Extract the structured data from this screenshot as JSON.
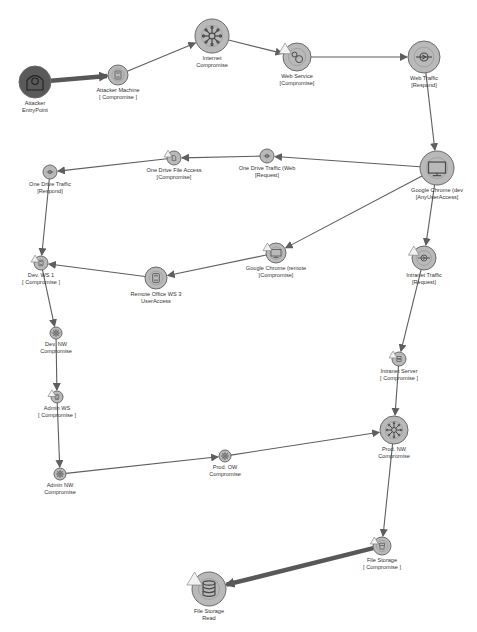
{
  "diagram": {
    "colors": {
      "node_fill": "#b9b9b9",
      "node_stroke": "#6a6a6a",
      "entry_fill": "#5a5a5a",
      "edge": "#5e5e5e",
      "critical_edge": "#585858",
      "label": "#333333",
      "warning": "#f2f2f2"
    },
    "nodes": [
      {
        "id": "attacker_entry",
        "label_1": "Attacker",
        "label_2": "EntryPoint",
        "x": 35,
        "y": 82,
        "r": 16,
        "icon": "hacker-icon",
        "kind": "entry",
        "warning": false
      },
      {
        "id": "attacker_machine",
        "label_1": "Attacker Machine",
        "label_2": "[ Compromise ]",
        "x": 118,
        "y": 75,
        "r": 10,
        "icon": "workstation-icon",
        "warning": false
      },
      {
        "id": "internet",
        "label_1": "Internet",
        "label_2": "Compromise",
        "x": 212,
        "y": 36,
        "r": 17,
        "icon": "network-hub-icon",
        "warning": false
      },
      {
        "id": "web_service",
        "label_1": "Web Service",
        "label_2": "[Compromise]",
        "x": 297,
        "y": 57,
        "r": 14,
        "icon": "gears-icon",
        "warning": true
      },
      {
        "id": "web_traffic",
        "label_1": "Web Traffic",
        "label_2": "[Respond]",
        "x": 424,
        "y": 57,
        "r": 16,
        "icon": "traffic-icon",
        "warning": false
      },
      {
        "id": "chrome_dev",
        "label_1": "Google Chrome (dev",
        "label_2": "[AnyUserAccess]",
        "x": 437,
        "y": 168,
        "r": 17,
        "icon": "monitor-icon",
        "warning": false
      },
      {
        "id": "onedrive_web",
        "label_1": "One Drive Traffic (Web",
        "label_2": "[Request]",
        "x": 267,
        "y": 156,
        "r": 7,
        "icon": "traffic-icon",
        "warning": false
      },
      {
        "id": "onedrive_file",
        "label_1": "One Drive File Access",
        "label_2": "[Compromise]",
        "x": 174,
        "y": 158,
        "r": 7,
        "icon": "file-access-icon",
        "warning": true
      },
      {
        "id": "onedrive_traffic",
        "label_1": "One Drive Traffic",
        "label_2": "[Respond]",
        "x": 50,
        "y": 172,
        "r": 7,
        "icon": "traffic-icon",
        "warning": false
      },
      {
        "id": "chrome_remote",
        "label_1": "Google Chrome (remote",
        "label_2": "[Compromise]",
        "x": 276,
        "y": 253,
        "r": 10,
        "icon": "monitor-icon",
        "warning": true
      },
      {
        "id": "remote_ws3",
        "label_1": "Remote Office WS 3",
        "label_2": "UserAccess",
        "x": 156,
        "y": 278,
        "r": 11,
        "icon": "workstation-icon",
        "warning": false
      },
      {
        "id": "dev_ws1",
        "label_1": "Dev. WS 1",
        "label_2": "[ Compromise ]",
        "x": 41,
        "y": 263,
        "r": 7,
        "icon": "workstation-icon",
        "warning": true
      },
      {
        "id": "intranet_traffic",
        "label_1": "Intranet Traffic",
        "label_2": "[Request]",
        "x": 424,
        "y": 258,
        "r": 12,
        "icon": "traffic-icon",
        "warning": true
      },
      {
        "id": "dev_nw",
        "label_1": "Dev. NW",
        "label_2": "Compromise",
        "x": 56,
        "y": 333,
        "r": 6,
        "icon": "network-hub-icon",
        "warning": false
      },
      {
        "id": "admin_ws",
        "label_1": "Admin WS",
        "label_2": "[ Compromise ]",
        "x": 57,
        "y": 397,
        "r": 6,
        "icon": "workstation-icon",
        "warning": true
      },
      {
        "id": "intranet_server",
        "label_1": "Intranet Server",
        "label_2": "[ Compromise ]",
        "x": 399,
        "y": 359,
        "r": 7,
        "icon": "server-icon",
        "warning": true
      },
      {
        "id": "admin_nw",
        "label_1": "Admin NW",
        "label_2": "Compromise",
        "x": 60,
        "y": 474,
        "r": 6,
        "icon": "network-hub-icon",
        "warning": false
      },
      {
        "id": "prod_ow",
        "label_1": "Prod. OW",
        "label_2": "Compromise",
        "x": 225,
        "y": 456,
        "r": 6,
        "icon": "network-hub-icon",
        "warning": false
      },
      {
        "id": "prod_nw",
        "label_1": "Prod. NW",
        "label_2": "Compromise",
        "x": 394,
        "y": 430,
        "r": 14,
        "icon": "network-hub-icon",
        "warning": false
      },
      {
        "id": "file_storage_c",
        "label_1": "File Storage",
        "label_2": "[ Compromise ]",
        "x": 382,
        "y": 546,
        "r": 9,
        "icon": "storage-icon",
        "warning": true
      },
      {
        "id": "file_storage_r",
        "label_1": "File Storage",
        "label_2": "Read",
        "x": 209,
        "y": 589,
        "r": 17,
        "icon": "database-icon",
        "warning": true
      }
    ],
    "edges": [
      {
        "from": "attacker_entry",
        "to": "attacker_machine",
        "thick": true
      },
      {
        "from": "attacker_machine",
        "to": "internet",
        "thick": false
      },
      {
        "from": "internet",
        "to": "web_service",
        "thick": false
      },
      {
        "from": "web_service",
        "to": "web_traffic",
        "thick": false
      },
      {
        "from": "web_traffic",
        "to": "chrome_dev",
        "thick": false
      },
      {
        "from": "chrome_dev",
        "to": "onedrive_web",
        "thick": false
      },
      {
        "from": "onedrive_web",
        "to": "onedrive_file",
        "thick": false
      },
      {
        "from": "onedrive_file",
        "to": "onedrive_traffic",
        "thick": false
      },
      {
        "from": "onedrive_traffic",
        "to": "dev_ws1",
        "thick": false
      },
      {
        "from": "chrome_dev",
        "to": "chrome_remote",
        "thick": false
      },
      {
        "from": "chrome_remote",
        "to": "remote_ws3",
        "thick": false
      },
      {
        "from": "remote_ws3",
        "to": "dev_ws1",
        "thick": false
      },
      {
        "from": "chrome_dev",
        "to": "intranet_traffic",
        "thick": false
      },
      {
        "from": "dev_ws1",
        "to": "dev_nw",
        "thick": false
      },
      {
        "from": "dev_nw",
        "to": "admin_ws",
        "thick": false
      },
      {
        "from": "admin_ws",
        "to": "admin_nw",
        "thick": false
      },
      {
        "from": "admin_nw",
        "to": "prod_ow",
        "thick": false
      },
      {
        "from": "prod_ow",
        "to": "prod_nw",
        "thick": false
      },
      {
        "from": "intranet_traffic",
        "to": "intranet_server",
        "thick": false
      },
      {
        "from": "intranet_server",
        "to": "prod_nw",
        "thick": false
      },
      {
        "from": "prod_nw",
        "to": "file_storage_c",
        "thick": false
      },
      {
        "from": "file_storage_c",
        "to": "file_storage_r",
        "thick": true
      }
    ]
  }
}
